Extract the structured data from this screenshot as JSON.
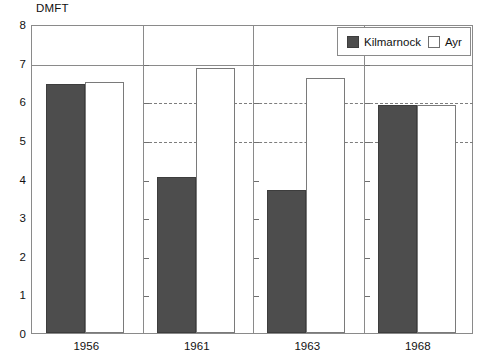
{
  "chart_data": {
    "type": "bar",
    "title": "",
    "ylabel": "DMFT",
    "xlabel": "",
    "categories": [
      "1956",
      "1961",
      "1963",
      "1968"
    ],
    "series": [
      {
        "name": "Kilmarnock",
        "color": "#4d4d4d",
        "values": [
          6.45,
          4.05,
          3.7,
          5.9
        ]
      },
      {
        "name": "Ayr",
        "color": "#ffffff",
        "values": [
          6.5,
          6.85,
          6.6,
          5.9
        ]
      }
    ],
    "ylim": [
      0,
      8
    ],
    "yticks": [
      "0",
      "1",
      "2",
      "3",
      "4",
      "5",
      "6",
      "7",
      "8"
    ],
    "ytick_values": [
      0,
      1,
      2,
      3,
      4,
      5,
      6,
      7,
      8
    ],
    "grid": "dashed gridlines at 5 and 6 within panels; solid rule at 7",
    "gridlines_dashed": [
      5,
      6
    ],
    "gridlines_solid": [
      7
    ],
    "legend_position": "top-right",
    "legend": [
      "Kilmarnock",
      "Ayr"
    ],
    "panels": [
      {
        "year": "1956",
        "kilmarnock": 6.45,
        "ayr": 6.5
      },
      {
        "year": "1961",
        "kilmarnock": 4.05,
        "ayr": 6.85
      },
      {
        "year": "1963",
        "kilmarnock": 3.7,
        "ayr": 6.6
      },
      {
        "year": "1968",
        "kilmarnock": 5.9,
        "ayr": 5.9
      }
    ]
  },
  "axis": {
    "y_title": "DMFT"
  },
  "legend": {
    "kilmarnock_label": "Kilmarnock",
    "ayr_label": "Ayr"
  }
}
